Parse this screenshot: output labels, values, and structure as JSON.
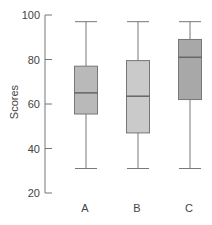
{
  "chart_data": {
    "type": "boxplot",
    "title": "",
    "xlabel": "",
    "ylabel": "Scores",
    "ylim": [
      20,
      100
    ],
    "yticks": [
      20,
      40,
      60,
      80,
      100
    ],
    "grid": false,
    "legend": null,
    "categories": [
      "A",
      "B",
      "C"
    ],
    "boxes": [
      {
        "name": "A",
        "min": 31,
        "q1": 55.5,
        "median": 65,
        "q3": 77,
        "max": 97,
        "color": "#b9b9b9"
      },
      {
        "name": "B",
        "min": 31,
        "q1": 47,
        "median": 63.5,
        "q3": 79.5,
        "max": 97,
        "color": "#cacaca"
      },
      {
        "name": "C",
        "min": 31,
        "q1": 62,
        "median": 81,
        "q3": 89,
        "max": 97,
        "color": "#a8a8a8"
      }
    ]
  },
  "style": {
    "axis_color": "#777777",
    "whisker_color": "#777777",
    "median_color": "#666666",
    "box_stroke": "#777777"
  }
}
